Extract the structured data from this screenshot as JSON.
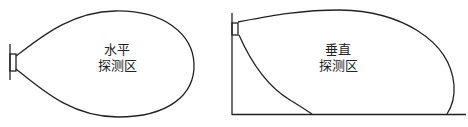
{
  "diagram": {
    "panels": [
      {
        "id": "horizontal",
        "label_line1": "水平",
        "label_line2": "探测区",
        "description": "Horizontal detection zone: teardrop-shaped lobe extending right from a wall-mounted sensor"
      },
      {
        "id": "vertical",
        "label_line1": "垂直",
        "label_line2": "探测区",
        "description": "Vertical detection zone: lobe extending from a sensor mounted high on a wall down to the floor"
      }
    ],
    "colors": {
      "stroke": "#222222",
      "background": "#ffffff"
    }
  }
}
